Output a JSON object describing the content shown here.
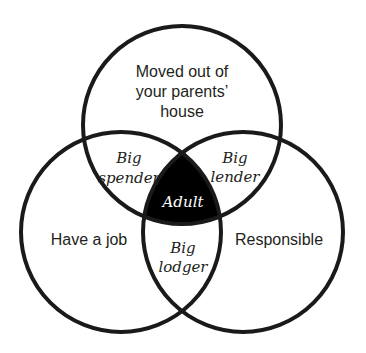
{
  "diagram": {
    "type": "venn",
    "colors": {
      "stroke": "#1a1a1a",
      "text": "#231f20",
      "center_fill": "#000000",
      "center_text": "#ffffff",
      "background": "#ffffff"
    },
    "sets": {
      "top": {
        "lines": [
          "Moved out of",
          "your parents’",
          "house"
        ]
      },
      "left": {
        "label": "Have a job"
      },
      "right": {
        "label": "Responsible"
      }
    },
    "intersections": {
      "top_left": {
        "lines": [
          "Big",
          "spender"
        ]
      },
      "top_right": {
        "lines": [
          "Big",
          "lender"
        ]
      },
      "left_right": {
        "lines": [
          "Big",
          "lodger"
        ]
      },
      "all": {
        "label": "Adult"
      }
    }
  }
}
